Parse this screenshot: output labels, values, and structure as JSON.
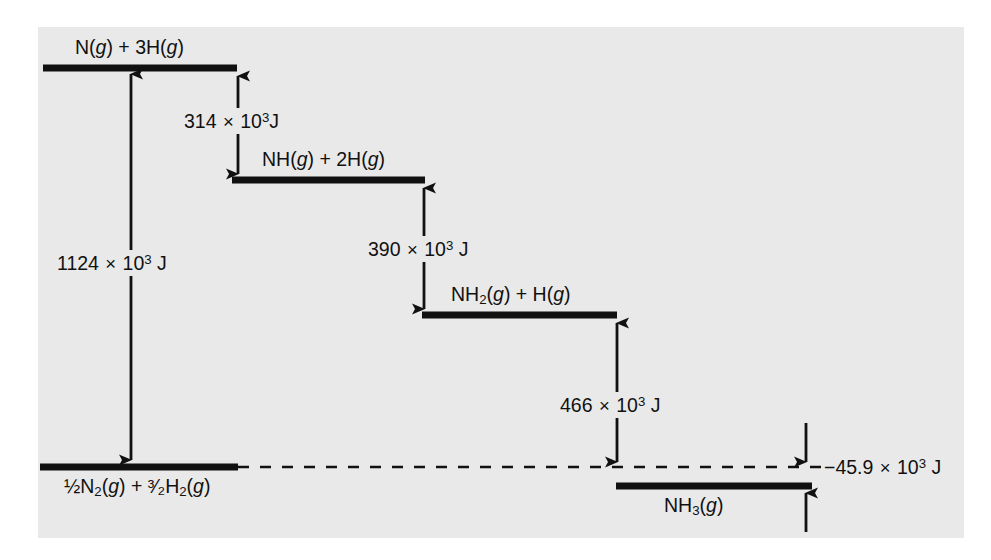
{
  "figure": {
    "background_color": "#ffffff",
    "plate_color": "#e9e9e9",
    "ink_color": "#111111"
  },
  "levels": [
    {
      "id": "level-n-3h",
      "label_html": "N(<i>g</i>) + 3H(<i>g</i>)",
      "label_plain": "N(g) + 3H(g)",
      "relative_energy_kj": 1124,
      "bar": {
        "x1": 43,
        "x2": 237,
        "y": 68
      },
      "label_pos": {
        "x": 75,
        "y": 38
      }
    },
    {
      "id": "level-nh-2h",
      "label_html": "NH(<i>g</i>) + 2H(<i>g</i>)",
      "label_plain": "NH(g) + 2H(g)",
      "relative_energy_kj": 810,
      "bar": {
        "x1": 232,
        "x2": 425,
        "y": 180
      },
      "label_pos": {
        "x": 262,
        "y": 150
      }
    },
    {
      "id": "level-nh2-h",
      "label_html": "NH<sub>2</sub>(<i>g</i>) + H(<i>g</i>)",
      "label_plain": "NH2(g) + H(g)",
      "relative_energy_kj": 420,
      "bar": {
        "x1": 422,
        "x2": 617,
        "y": 315
      },
      "label_pos": {
        "x": 451,
        "y": 285
      }
    },
    {
      "id": "level-reactants",
      "label_html": "½N<sub>2</sub>(<i>g</i>) + ³⁄₂H<sub>2</sub>(<i>g</i>)",
      "label_plain": "1/2 N2(g) + 3/2 H2(g)",
      "relative_energy_kj": 0,
      "bar": {
        "x1": 40,
        "x2": 238,
        "y": 467
      },
      "label_pos": {
        "x": 64,
        "y": 477
      }
    },
    {
      "id": "level-nh3",
      "label_html": "NH<sub>3</sub>(<i>g</i>)",
      "label_plain": "NH3(g)",
      "relative_energy_kj": -45.9,
      "bar": {
        "x1": 616,
        "x2": 812,
        "y": 486
      },
      "label_pos": {
        "x": 664,
        "y": 496
      }
    }
  ],
  "dashed_baseline": {
    "x1": 238,
    "x2": 822,
    "y": 467
  },
  "arrows": [
    {
      "id": "arrow-1124",
      "x": 131,
      "y_top": 68,
      "y_bottom": 466,
      "heads": "both",
      "label_html": "1124 <span class=\"times\">×</span> 10<sup>3</sup> J",
      "label_plain": "1124 × 10³ J",
      "label_pos": {
        "x": 55,
        "y": 253
      },
      "label_on_plate": true
    },
    {
      "id": "arrow-314",
      "x": 238,
      "y_top": 70,
      "y_bottom": 180,
      "heads": "both",
      "label_html": "314 <span class=\"times\">×</span> 10<sup>3</sup>J",
      "label_plain": "314 × 10³J",
      "label_pos": {
        "x": 182,
        "y": 111
      },
      "label_on_plate": true
    },
    {
      "id": "arrow-390",
      "x": 424,
      "y_top": 182,
      "y_bottom": 315,
      "heads": "both",
      "label_html": "390 <span class=\"times\">×</span> 10<sup>3</sup> J",
      "label_plain": "390 × 10³ J",
      "label_pos": {
        "x": 366,
        "y": 239
      },
      "label_on_plate": true
    },
    {
      "id": "arrow-466",
      "x": 617,
      "y_top": 317,
      "y_bottom": 468,
      "heads": "both",
      "label_html": "466 <span class=\"times\">×</span> 10<sup>3</sup> J",
      "label_plain": "466 × 10³ J",
      "label_pos": {
        "x": 558,
        "y": 395
      },
      "label_on_plate": true
    },
    {
      "id": "arrow-minus-45-9-upper",
      "x": 806,
      "y_top": 423,
      "y_bottom": 468,
      "heads": "down",
      "label_html": "",
      "label_plain": ""
    },
    {
      "id": "arrow-minus-45-9-lower",
      "x": 806,
      "y_top": 487,
      "y_bottom": 532,
      "heads": "up",
      "label_html": "",
      "label_plain": ""
    }
  ],
  "annotations": [
    {
      "id": "annotation-minus-45-9",
      "label_html": "−45.9 <span class=\"times\">×</span> 10<sup>3</sup> J",
      "label_plain": "−45.9 × 10³ J",
      "label_pos": {
        "x": 824,
        "y": 466
      }
    }
  ],
  "chart_data": {
    "type": "line",
    "xlabel": "",
    "ylabel": "Energy (J)",
    "ylim": [
      -100000,
      1200000
    ],
    "grid": false,
    "legend": "none",
    "categories": [
      "½N₂(g) + ³⁄₂H₂(g)",
      "N(g) + 3H(g)",
      "NH(g) + 2H(g)",
      "NH₂(g) + H(g)",
      "NH₃(g)"
    ],
    "values": [
      0,
      1124000,
      810000,
      420000,
      -45900
    ],
    "transitions": [
      {
        "from": "½N₂(g) + ³⁄₂H₂(g)",
        "to": "N(g) + 3H(g)",
        "delta_J": 1124000,
        "label": "1124 × 10³ J"
      },
      {
        "from": "N(g) + 3H(g)",
        "to": "NH(g) + 2H(g)",
        "delta_J": -314000,
        "label": "314 × 10³J"
      },
      {
        "from": "NH(g) + 2H(g)",
        "to": "NH₂(g) + H(g)",
        "delta_J": -390000,
        "label": "390 × 10³ J"
      },
      {
        "from": "NH₂(g) + H(g)",
        "to": "NH₃(g)",
        "delta_J": -466000,
        "label": "466 × 10³ J"
      },
      {
        "from": "½N₂(g) + ³⁄₂H₂(g)",
        "to": "NH₃(g)",
        "delta_J": -45900,
        "label": "−45.9 × 10³ J"
      }
    ]
  }
}
